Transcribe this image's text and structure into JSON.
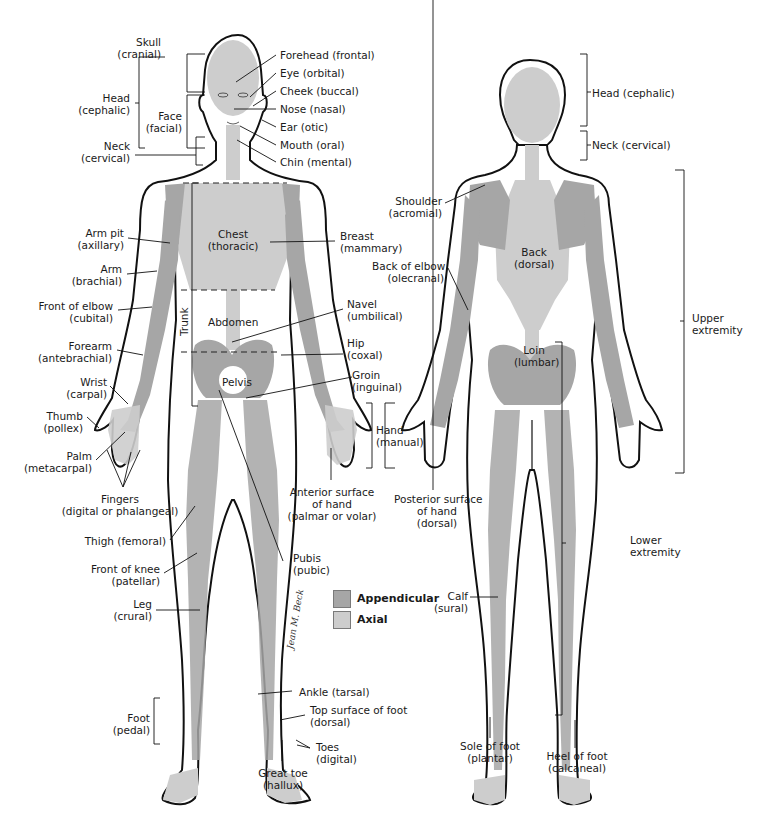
{
  "figure": {
    "colors": {
      "appendicular": "#a6a6a6",
      "axial": "#cdcdcd",
      "outline": "#111111",
      "background": "#ffffff"
    },
    "legend": [
      {
        "label": "Appendicular",
        "color": "#a6a6a6"
      },
      {
        "label": "Axial",
        "color": "#cdcdcd"
      }
    ],
    "signature": "Jean M. Beck",
    "anterior": {
      "left_labels": {
        "skull": [
          "Skull",
          "(cranial)"
        ],
        "head": [
          "Head",
          "(cephalic)"
        ],
        "face": [
          "Face",
          "(facial)"
        ],
        "neck": [
          "Neck",
          "(cervical)"
        ],
        "arm_pit": [
          "Arm pit",
          "(axillary)"
        ],
        "arm": [
          "Arm",
          "(brachial)"
        ],
        "front_elbow": [
          "Front of elbow",
          "(cubital)"
        ],
        "forearm": [
          "Forearm",
          "(antebrachial)"
        ],
        "wrist": [
          "Wrist",
          "(carpal)"
        ],
        "thumb": [
          "Thumb",
          "(pollex)"
        ],
        "palm": [
          "Palm",
          "(metacarpal)"
        ],
        "fingers": [
          "Fingers",
          "(digital or phalangeal)"
        ],
        "thigh": "Thigh (femoral)",
        "front_knee": [
          "Front of knee",
          "(patellar)"
        ],
        "leg": [
          "Leg",
          "(crural)"
        ],
        "foot": [
          "Foot",
          "(pedal)"
        ]
      },
      "right_labels": {
        "forehead": "Forehead (frontal)",
        "eye": "Eye (orbital)",
        "cheek": "Cheek (buccal)",
        "nose": "Nose (nasal)",
        "ear": "Ear (otic)",
        "mouth": "Mouth (oral)",
        "chin": "Chin (mental)",
        "breast": [
          "Breast",
          "(mammary)"
        ],
        "navel": [
          "Navel",
          "(umbilical)"
        ],
        "hip": [
          "Hip",
          "(coxal)"
        ],
        "groin": [
          "Groin",
          "(inguinal)"
        ],
        "hand": [
          "Hand",
          "(manual)"
        ],
        "anterior_hand": [
          "Anterior surface",
          "of hand",
          "(palmar or volar)"
        ],
        "pubis": [
          "Pubis",
          "(pubic)"
        ],
        "ankle": "Ankle (tarsal)",
        "top_foot": [
          "Top surface of foot",
          "(dorsal)"
        ],
        "toes": [
          "Toes",
          "(digital)"
        ],
        "great_toe": [
          "Great toe",
          "(hallux)"
        ]
      },
      "body_labels": {
        "chest": [
          "Chest",
          "(thoracic)"
        ],
        "abdomen": "Abdomen",
        "pelvis": "Pelvis",
        "trunk": "Trunk"
      }
    },
    "posterior": {
      "labels": {
        "head": "Head (cephalic)",
        "neck": "Neck (cervical)",
        "shoulder": [
          "Shoulder",
          "(acromial)"
        ],
        "back_elbow": [
          "Back of elbow",
          "(olecranal)"
        ],
        "back": [
          "Back",
          "(dorsal)"
        ],
        "loin": [
          "Loin",
          "(lumbar)"
        ],
        "upper_extremity": [
          "Upper",
          "extremity"
        ],
        "posterior_hand": [
          "Posterior surface",
          "of hand",
          "(dorsal)"
        ],
        "lower_extremity": [
          "Lower",
          "extremity"
        ],
        "calf": [
          "Calf",
          "(sural)"
        ],
        "sole": [
          "Sole of foot",
          "(plantar)"
        ],
        "heel": [
          "Heel of foot",
          "(calcaneal)"
        ]
      }
    }
  }
}
